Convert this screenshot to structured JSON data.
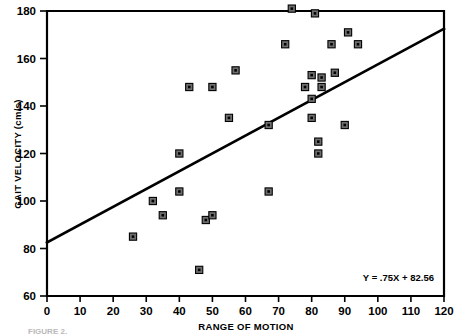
{
  "figure": {
    "caption": "FIGURE 2.",
    "equation_label": "Y = .75X + 82.56"
  },
  "chart_data": {
    "type": "scatter",
    "title": "",
    "xlabel": "RANGE OF MOTION",
    "ylabel": "GAIT VELOCITY (cm/s)",
    "xlim": [
      0,
      120
    ],
    "ylim": [
      60,
      180
    ],
    "xticks": [
      0,
      10,
      20,
      30,
      40,
      50,
      60,
      70,
      80,
      90,
      100,
      110,
      120
    ],
    "yticks": [
      60,
      80,
      100,
      120,
      140,
      160,
      180
    ],
    "xtick_labels": [
      "0",
      "10",
      "20",
      "30",
      "40",
      "50",
      "60",
      "70",
      "80",
      "90",
      "100",
      "110",
      "120"
    ],
    "ytick_labels": [
      "60",
      "80",
      "100",
      "120",
      "140",
      "160",
      "180"
    ],
    "grid": false,
    "legend": null,
    "marker": "square",
    "marker_color": "#6e6e6e",
    "marker_edge_color": "#000000",
    "line_color": "#000000",
    "annotations": [
      {
        "text": "Y = .75X + 82.56",
        "x": 93,
        "y": 67
      }
    ],
    "fit_line": {
      "equation": "Y = .75X + 82.56",
      "slope": 0.75,
      "intercept": 82.56,
      "x_start": 0,
      "x_end": 120,
      "y_start": 82.56,
      "y_end": 172.56
    },
    "points": [
      {
        "x": 26,
        "y": 85
      },
      {
        "x": 32,
        "y": 100
      },
      {
        "x": 35,
        "y": 94
      },
      {
        "x": 40,
        "y": 104
      },
      {
        "x": 40,
        "y": 120
      },
      {
        "x": 43,
        "y": 148
      },
      {
        "x": 46,
        "y": 71
      },
      {
        "x": 48,
        "y": 92
      },
      {
        "x": 50,
        "y": 94
      },
      {
        "x": 50,
        "y": 148
      },
      {
        "x": 55,
        "y": 135
      },
      {
        "x": 57,
        "y": 155
      },
      {
        "x": 67,
        "y": 104
      },
      {
        "x": 67,
        "y": 132
      },
      {
        "x": 72,
        "y": 166
      },
      {
        "x": 74,
        "y": 181
      },
      {
        "x": 78,
        "y": 148
      },
      {
        "x": 80,
        "y": 143
      },
      {
        "x": 80,
        "y": 153
      },
      {
        "x": 80,
        "y": 135
      },
      {
        "x": 81,
        "y": 179
      },
      {
        "x": 82,
        "y": 125
      },
      {
        "x": 82,
        "y": 120
      },
      {
        "x": 83,
        "y": 148
      },
      {
        "x": 83,
        "y": 152
      },
      {
        "x": 86,
        "y": 166
      },
      {
        "x": 87,
        "y": 154
      },
      {
        "x": 90,
        "y": 132
      },
      {
        "x": 91,
        "y": 171
      },
      {
        "x": 94,
        "y": 166
      }
    ]
  }
}
